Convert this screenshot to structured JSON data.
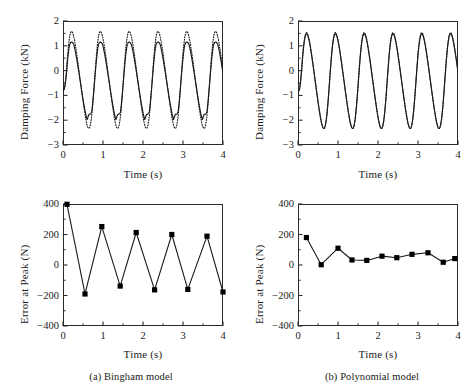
{
  "figure": {
    "panels": [
      {
        "id": "a-force",
        "caption": "",
        "chart_index": 0
      },
      {
        "id": "b-force",
        "caption": "",
        "chart_index": 1
      },
      {
        "id": "a-error",
        "caption": "(a) Bingham model",
        "chart_index": 2
      },
      {
        "id": "b-error",
        "caption": "(b) Polynomial model",
        "chart_index": 3
      }
    ],
    "captions": {
      "a": "(a) Bingham model",
      "b": "(b) Polynomial model"
    },
    "colors": {
      "axis": "#2b2b2b",
      "line": "#1a1a1a",
      "marker": "#000000",
      "background": "#ffffff"
    }
  },
  "chart_data": [
    {
      "type": "line",
      "title": "",
      "xlabel": "Time (s)",
      "ylabel": "Damping Force (kN)",
      "xlim": [
        0,
        4
      ],
      "ylim": [
        -3,
        2
      ],
      "xticks": [
        0,
        1,
        2,
        3,
        4
      ],
      "xticklabels": [
        "0",
        "1",
        "2",
        "3",
        "4"
      ],
      "yticks": [
        -3,
        -2,
        -1,
        0,
        1,
        2
      ],
      "yticklabels": [
        "-3",
        "-2",
        "-1",
        "0",
        "1",
        "2"
      ],
      "minor_xticks": [
        0.5,
        1.5,
        2.5,
        3.5
      ],
      "minor_yticks": [
        -2.5,
        -1.5,
        -0.5,
        0.5,
        1.5
      ],
      "grid": false,
      "legend": false,
      "series": [
        {
          "name": "Bingham model (predicted)",
          "style": "solid",
          "period": 0.72,
          "phase": 0.07,
          "peak": 1.3,
          "trough": -2.15,
          "shape": "bingham",
          "comment": "solid curve, clipped/kinked shoulders, lower peak magnitude"
        },
        {
          "name": "Experimental",
          "style": "dotted",
          "period": 0.72,
          "phase": 0.07,
          "peak": 1.65,
          "trough": -2.4,
          "shape": "smooth",
          "comment": "dotted curve, rounded higher peaks and deeper troughs"
        }
      ]
    },
    {
      "type": "line",
      "title": "",
      "xlabel": "Time (s)",
      "ylabel": "Damping Force (kN)",
      "xlim": [
        0,
        4
      ],
      "ylim": [
        -3,
        2
      ],
      "xticks": [
        0,
        1,
        2,
        3,
        4
      ],
      "xticklabels": [
        "0",
        "1",
        "2",
        "3",
        "4"
      ],
      "yticks": [
        -3,
        -2,
        -1,
        0,
        1,
        2
      ],
      "yticklabels": [
        "-3",
        "-2",
        "-1",
        "0",
        "1",
        "2"
      ],
      "minor_xticks": [
        0.5,
        1.5,
        2.5,
        3.5
      ],
      "minor_yticks": [
        -2.5,
        -1.5,
        -0.5,
        0.5,
        1.5
      ],
      "grid": false,
      "legend": false,
      "series": [
        {
          "name": "Polynomial model (predicted)",
          "style": "solid",
          "period": 0.72,
          "phase": 0.07,
          "peak": 1.55,
          "trough": -2.4,
          "shape": "smooth",
          "comment": "solid curve closely overlapping experimental data"
        },
        {
          "name": "Experimental",
          "style": "dotted",
          "period": 0.72,
          "phase": 0.07,
          "peak": 1.6,
          "trough": -2.4,
          "shape": "smooth",
          "comment": "dotted curve nearly coincident with model"
        }
      ]
    },
    {
      "type": "line",
      "title": "",
      "xlabel": "Time (s)",
      "ylabel": "Error at Peak (N)",
      "xlim": [
        0,
        4
      ],
      "ylim": [
        -400,
        400
      ],
      "xticks": [
        0,
        1,
        2,
        3,
        4
      ],
      "xticklabels": [
        "0",
        "1",
        "2",
        "3",
        "4"
      ],
      "yticks": [
        -400,
        -200,
        0,
        200,
        400
      ],
      "yticklabels": [
        "-400",
        "-200",
        "0",
        "200",
        "400"
      ],
      "minor_xticks": [
        0.5,
        1.5,
        2.5,
        3.5
      ],
      "minor_yticks": [
        -300,
        -100,
        100,
        300
      ],
      "grid": false,
      "legend": false,
      "marker": "square",
      "series": [
        {
          "name": "Bingham error at peak",
          "style": "solid-marker",
          "x": [
            0.1,
            0.55,
            0.97,
            1.43,
            1.83,
            2.29,
            2.72,
            3.12,
            3.6,
            4.0
          ],
          "y": [
            398,
            -190,
            252,
            -138,
            213,
            -163,
            200,
            -160,
            189,
            -177
          ]
        }
      ]
    },
    {
      "type": "line",
      "title": "",
      "xlabel": "Time (s)",
      "ylabel": "Error at Peak (N)",
      "xlim": [
        0,
        4
      ],
      "ylim": [
        -400,
        400
      ],
      "xticks": [
        0,
        1,
        2,
        3,
        4
      ],
      "xticklabels": [
        "0",
        "1",
        "2",
        "3",
        "4"
      ],
      "yticks": [
        -400,
        -200,
        0,
        200,
        400
      ],
      "yticklabels": [
        "-400",
        "-200",
        "0",
        "200",
        "400"
      ],
      "minor_xticks": [
        0.5,
        1.5,
        2.5,
        3.5
      ],
      "minor_yticks": [
        -300,
        -100,
        100,
        300
      ],
      "grid": false,
      "legend": false,
      "marker": "square",
      "series": [
        {
          "name": "Polynomial error at peak",
          "style": "solid-marker",
          "x": [
            0.21,
            0.58,
            1.0,
            1.35,
            1.72,
            2.1,
            2.47,
            2.85,
            3.25,
            3.63,
            3.92
          ],
          "y": [
            180,
            2,
            110,
            33,
            30,
            58,
            48,
            70,
            80,
            18,
            42
          ]
        }
      ]
    }
  ]
}
